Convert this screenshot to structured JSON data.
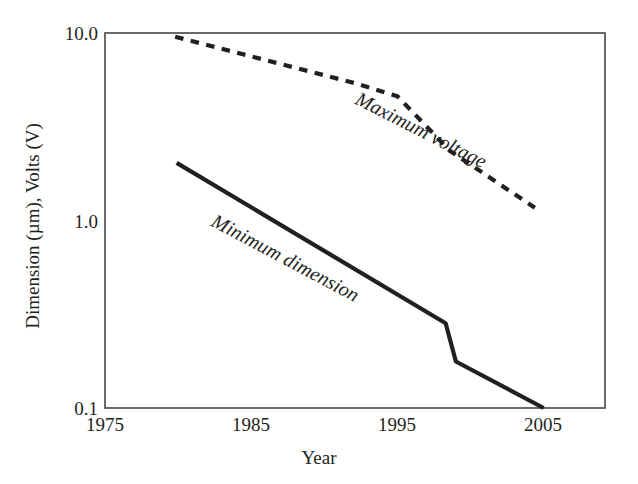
{
  "chart_data": {
    "type": "line",
    "title": "",
    "xlabel": "Year",
    "ylabel": "Dimension (µm), Volts (V)",
    "xlim": [
      1975,
      2009.2
    ],
    "ylim": [
      0.1,
      10.0
    ],
    "yscale": "log",
    "grid": false,
    "legend_position": "inline-annotations",
    "xticks": [
      "1975",
      "1985",
      "1995",
      "2005"
    ],
    "xtick_values": [
      1975,
      1985,
      1995,
      2005
    ],
    "yticks": [
      "10.0",
      "1.0",
      "0.1"
    ],
    "ytick_values": [
      10.0,
      1.0,
      0.1
    ],
    "series": [
      {
        "name": "Maximum voltage",
        "style": "dashed",
        "color": "#231f20",
        "annotation": "Maximum voltage",
        "x": [
          1979.8,
          1992.1,
          1995.0,
          1998.6,
          2004.4
        ],
        "values": [
          9.55,
          5.4,
          4.6,
          2.35,
          1.17
        ]
      },
      {
        "name": "Minimum dimension",
        "style": "solid",
        "color": "#231f20",
        "annotation": "Minimum dimension",
        "x": [
          1979.9,
          1998.3,
          1999.0,
          2005.0
        ],
        "values": [
          2.03,
          0.283,
          0.177,
          0.1
        ]
      }
    ]
  },
  "axes": {
    "x_tick_labels": [
      "1975",
      "1985",
      "1995",
      "2005"
    ],
    "y_tick_labels": [
      "10.0",
      "1.0",
      "0.1"
    ],
    "x_axis_title": "Year",
    "y_axis_title": "Dimension (µm), Volts (V)"
  },
  "annotations": {
    "maximum_voltage": "Maximum voltage",
    "minimum_dimension": "Minimum dimension"
  },
  "colors": {
    "ink": "#231f20",
    "background": "#ffffff",
    "axis": "#4a4a4a"
  }
}
